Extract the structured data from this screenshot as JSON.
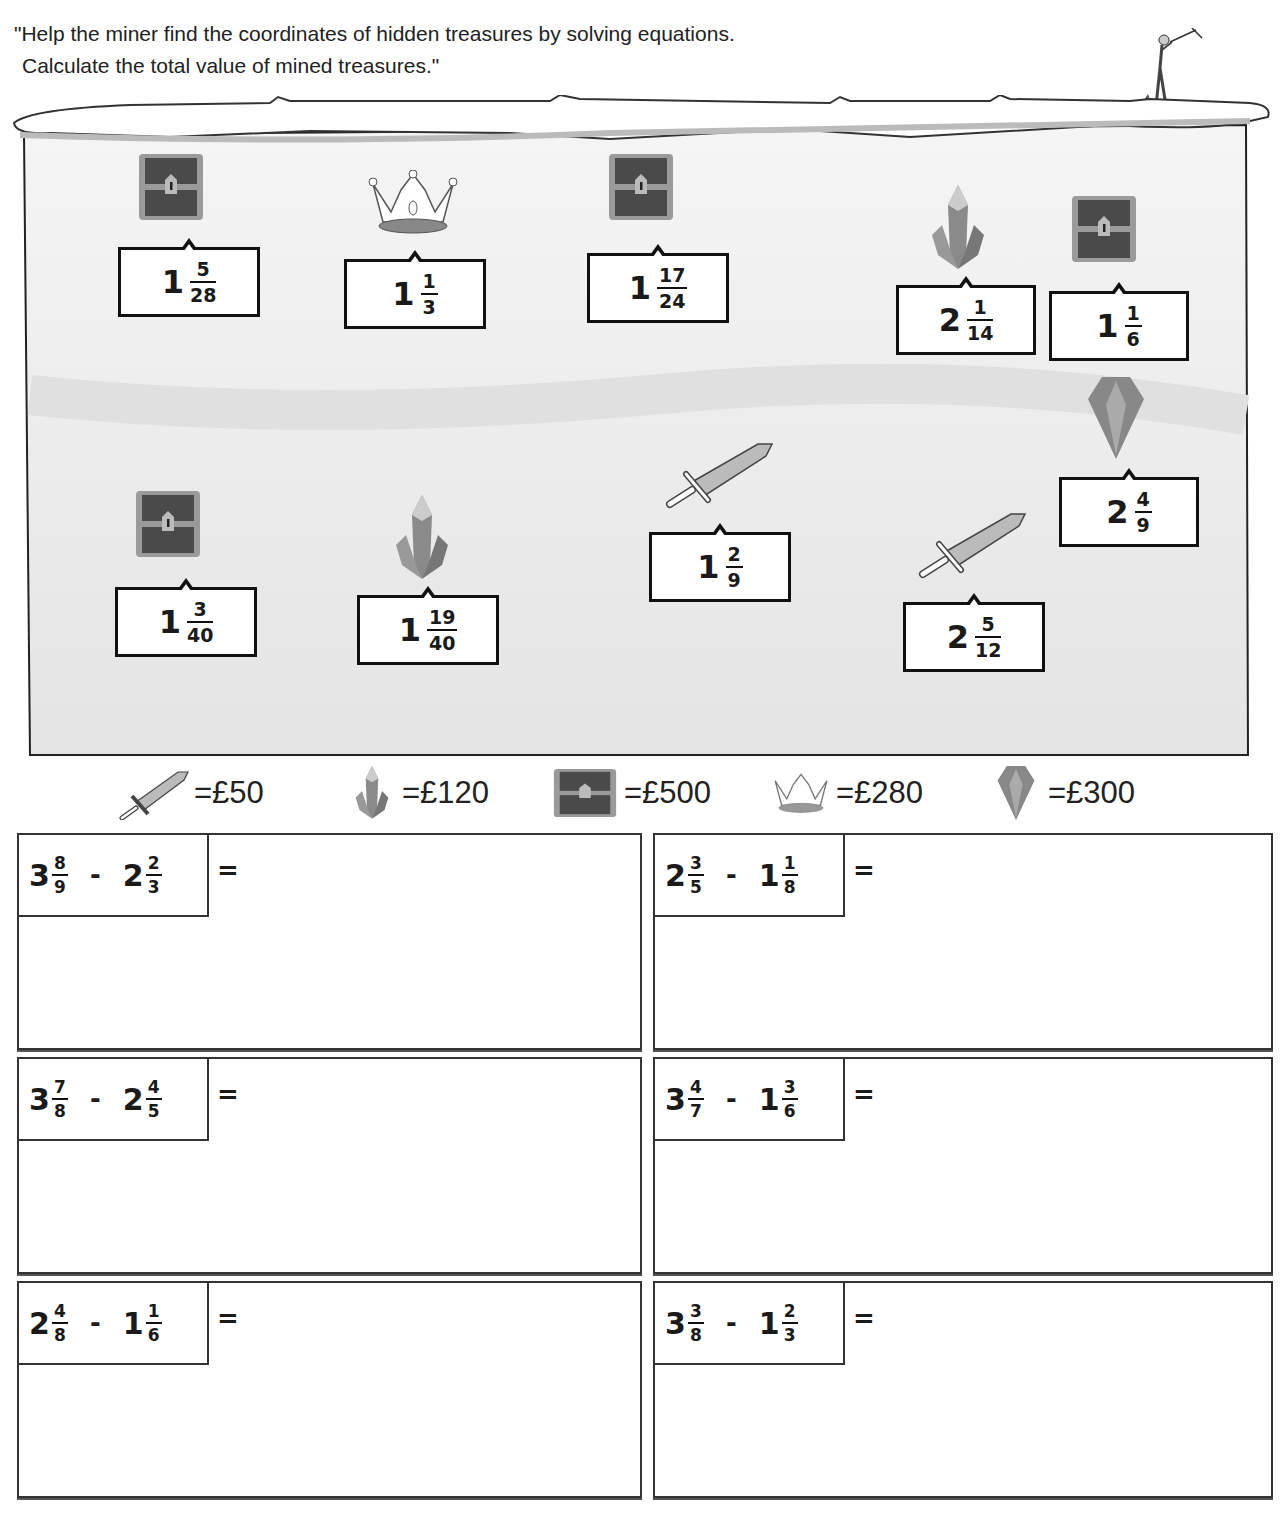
{
  "instructions": {
    "line1": "\"Help the miner find the coordinates of hidden treasures by solving equations.",
    "line2": "Calculate the total value of mined treasures.\""
  },
  "treasures": [
    {
      "type": "chest",
      "whole": "1",
      "num": "5",
      "den": "28"
    },
    {
      "type": "crown",
      "whole": "1",
      "num": "1",
      "den": "3"
    },
    {
      "type": "chest",
      "whole": "1",
      "num": "17",
      "den": "24"
    },
    {
      "type": "crystal",
      "whole": "2",
      "num": "1",
      "den": "14"
    },
    {
      "type": "chest",
      "whole": "1",
      "num": "1",
      "den": "6"
    },
    {
      "type": "diamond",
      "whole": "2",
      "num": "4",
      "den": "9"
    },
    {
      "type": "sword",
      "whole": "1",
      "num": "2",
      "den": "9"
    },
    {
      "type": "chest",
      "whole": "1",
      "num": "3",
      "den": "40"
    },
    {
      "type": "crystal",
      "whole": "1",
      "num": "19",
      "den": "40"
    },
    {
      "type": "sword",
      "whole": "2",
      "num": "5",
      "den": "12"
    }
  ],
  "legend": [
    {
      "icon": "sword-icon",
      "value": "=£50"
    },
    {
      "icon": "crystal-icon",
      "value": "=£120"
    },
    {
      "icon": "chest-icon",
      "value": "=£500"
    },
    {
      "icon": "crown-icon",
      "value": "=£280"
    },
    {
      "icon": "diamond-icon",
      "value": "=£300"
    }
  ],
  "problems": [
    {
      "a_whole": "3",
      "a_num": "8",
      "a_den": "9",
      "op": "-",
      "b_whole": "2",
      "b_num": "2",
      "b_den": "3",
      "eq": "="
    },
    {
      "a_whole": "2",
      "a_num": "3",
      "a_den": "5",
      "op": "-",
      "b_whole": "1",
      "b_num": "1",
      "b_den": "8",
      "eq": "="
    },
    {
      "a_whole": "3",
      "a_num": "7",
      "a_den": "8",
      "op": "-",
      "b_whole": "2",
      "b_num": "4",
      "b_den": "5",
      "eq": "="
    },
    {
      "a_whole": "3",
      "a_num": "4",
      "a_den": "7",
      "op": "-",
      "b_whole": "1",
      "b_num": "3",
      "b_den": "6",
      "eq": "="
    },
    {
      "a_whole": "2",
      "a_num": "4",
      "a_den": "8",
      "op": "-",
      "b_whole": "1",
      "b_num": "1",
      "b_den": "6",
      "eq": "="
    },
    {
      "a_whole": "3",
      "a_num": "3",
      "a_den": "8",
      "op": "-",
      "b_whole": "1",
      "b_num": "2",
      "b_den": "3",
      "eq": "="
    }
  ]
}
